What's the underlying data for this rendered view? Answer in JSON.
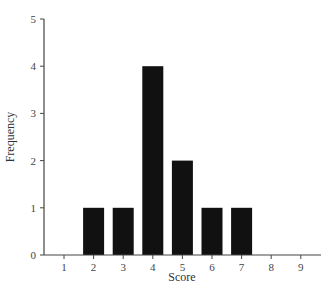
{
  "chart_data": {
    "type": "bar",
    "title": "",
    "xlabel": "Score",
    "ylabel": "Frequency",
    "categories": [
      "1",
      "2",
      "3",
      "4",
      "5",
      "6",
      "7",
      "8",
      "9"
    ],
    "values": [
      0,
      1,
      1,
      4,
      2,
      1,
      1,
      0,
      0
    ],
    "xlim": [
      0.3,
      9.7
    ],
    "ylim": [
      0,
      5
    ],
    "yticks": [
      0,
      1,
      2,
      3,
      4,
      5
    ],
    "xticks": [
      1,
      2,
      3,
      4,
      5,
      6,
      7,
      8,
      9
    ],
    "grid": false,
    "legend": null,
    "bar_color": "#111111",
    "axis_color": "#444444"
  }
}
